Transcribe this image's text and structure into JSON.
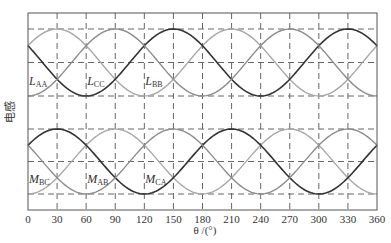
{
  "chart_data": {
    "type": "line",
    "title": "",
    "xlabel": "θ /(°)",
    "ylabel": "电感",
    "xlim": [
      0,
      360
    ],
    "xticks": [
      0,
      30,
      60,
      90,
      120,
      150,
      180,
      210,
      240,
      270,
      300,
      330,
      360
    ],
    "grid": "dashed",
    "legend": "inline labels",
    "panels": [
      {
        "name": "self-inductance",
        "levels": {
          "max": 1,
          "mid": 0,
          "min": -1
        },
        "series": [
          {
            "name": "L_AA",
            "label_main": "L",
            "label_sub": "AA",
            "peaks_deg": [
              30,
              210
            ],
            "troughs_deg": [
              120,
              300
            ],
            "color": "#a8a8a8",
            "label_theta": 0,
            "label_level": -0.55
          },
          {
            "name": "L_CC",
            "label_main": "L",
            "label_sub": "CC",
            "peaks_deg": [
              150,
              330
            ],
            "troughs_deg": [
              60,
              240
            ],
            "color": "#333333",
            "label_theta": 60,
            "label_level": -0.55
          },
          {
            "name": "L_BB",
            "label_main": "L",
            "label_sub": "BB",
            "peaks_deg": [
              90,
              270
            ],
            "troughs_deg": [
              0,
              180
            ],
            "color": "#8c8c8c",
            "label_theta": 120,
            "label_level": -0.55
          }
        ]
      },
      {
        "name": "mutual-inductance",
        "levels": {
          "max": 1,
          "mid": 0,
          "min": -1
        },
        "series": [
          {
            "name": "M_BC",
            "label_main": "M",
            "label_sub": "BC",
            "peaks_deg": [
              90,
              270
            ],
            "troughs_deg": [
              0,
              180
            ],
            "color": "#a8a8a8",
            "label_theta": 0,
            "label_level": -0.55
          },
          {
            "name": "M_AB",
            "label_main": "M",
            "label_sub": "AB",
            "peaks_deg": [
              30,
              210
            ],
            "troughs_deg": [
              120,
              300
            ],
            "color": "#333333",
            "label_theta": 60,
            "label_level": -0.55
          },
          {
            "name": "M_CA",
            "label_main": "M",
            "label_sub": "CA",
            "peaks_deg": [
              150,
              330
            ],
            "troughs_deg": [
              60,
              240
            ],
            "color": "#8c8c8c",
            "label_theta": 120,
            "label_level": -0.55
          }
        ]
      }
    ]
  }
}
